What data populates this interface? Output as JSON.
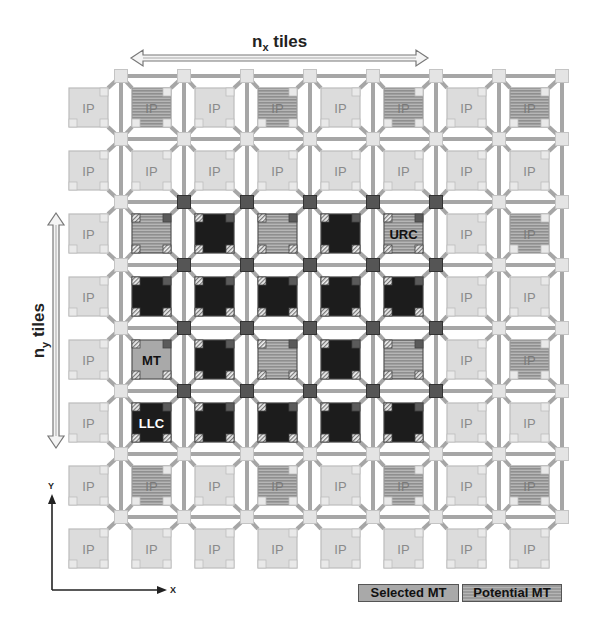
{
  "diagram": {
    "title_x": "n",
    "title_x_sub": "x",
    "title_x_suffix": " tiles",
    "title_y": "n",
    "title_y_sub": "y",
    "title_y_suffix": " tiles",
    "axis_x_label": "X",
    "axis_y_label": "Y",
    "legend": {
      "selected": "Selected MT",
      "potential": "Potential MT"
    },
    "grid": {
      "cols": 8,
      "rows": 8,
      "rows_data": [
        [
          "IP",
          "PMT:IP",
          "IP",
          "PMT:IP",
          "IP",
          "PMT:IP",
          "IP",
          "PMT:IP"
        ],
        [
          "IP",
          "IP",
          "IP",
          "IP",
          "IP",
          "IP",
          "IP",
          "IP"
        ],
        [
          "IP",
          "PMT-LLC",
          "LLC",
          "PMT-LLC",
          "LLC",
          "PMT-LLC:URC",
          "IP",
          "PMT:IP"
        ],
        [
          "IP",
          "LLC",
          "LLC",
          "LLC",
          "LLC",
          "LLC",
          "IP",
          "IP"
        ],
        [
          "IP",
          "SMT:MT",
          "LLC",
          "PMT-LLC",
          "LLC",
          "PMT-LLC",
          "IP",
          "PMT:IP"
        ],
        [
          "IP",
          "LLC:LLC",
          "LLC",
          "LLC",
          "LLC",
          "LLC",
          "IP",
          "IP"
        ],
        [
          "IP",
          "PMT:IP",
          "IP",
          "PMT:IP",
          "IP",
          "PMT:IP",
          "IP",
          "PMT:IP"
        ],
        [
          "IP",
          "IP",
          "IP",
          "IP",
          "IP",
          "IP",
          "IP",
          "IP"
        ]
      ],
      "dark_router_cols": [
        1,
        2,
        3,
        4,
        5
      ],
      "dark_router_rows": [
        2,
        3,
        4,
        5
      ]
    },
    "colors": {
      "ip_tile": "#dcdcdc",
      "ip_text": "#8a8a8a",
      "llc_tile": "#1c1c1c",
      "selected_mt": "#a9a9a9",
      "potential_mt_a": "#9a9a9a",
      "potential_mt_b": "#b8b8b8",
      "link": "#a6a6a6",
      "router_light": "#e4e4e4",
      "router_dark": "#555555"
    }
  }
}
